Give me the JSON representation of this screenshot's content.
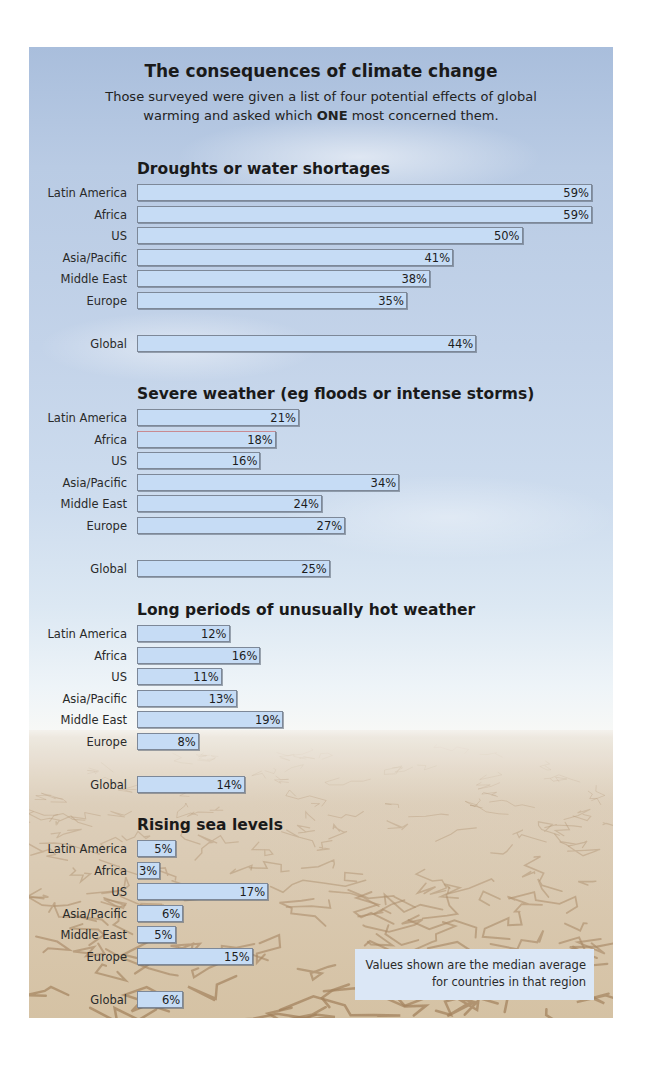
{
  "header": {
    "title": "The consequences of climate change",
    "subtitle_part1": "Those surveyed were given a list of four potential effects of global warming and asked which ",
    "subtitle_emphasis": "ONE",
    "subtitle_part2": " most concerned them."
  },
  "note": {
    "line1": "Values shown are the median average",
    "line2": "for countries in that region"
  },
  "colors": {
    "bar_fill": "#c6dcf5",
    "bar_border": "#7d8898",
    "note_fill": "#dbe7f6",
    "sky": "#b9cbe4",
    "ground": "#d5c2a4"
  },
  "chart_data": [
    {
      "type": "bar",
      "orientation": "horizontal",
      "title": "Droughts or water shortages",
      "categories": [
        "Latin America",
        "Africa",
        "US",
        "Asia/Pacific",
        "Middle East",
        "Europe",
        "Global"
      ],
      "values": [
        59,
        59,
        50,
        41,
        38,
        35,
        44
      ],
      "labels": [
        "59%",
        "59%",
        "50%",
        "41%",
        "38%",
        "35%",
        "44%"
      ],
      "unit": "%",
      "xlim": [
        0,
        60
      ]
    },
    {
      "type": "bar",
      "orientation": "horizontal",
      "title": "Severe weather (eg floods or intense storms)",
      "categories": [
        "Latin America",
        "Africa",
        "US",
        "Asia/Pacific",
        "Middle East",
        "Europe",
        "Global"
      ],
      "values": [
        21,
        18,
        16,
        34,
        24,
        27,
        25
      ],
      "labels": [
        "21%",
        "18%",
        "16%",
        "34%",
        "24%",
        "27%",
        "25%"
      ],
      "unit": "%",
      "xlim": [
        0,
        60
      ]
    },
    {
      "type": "bar",
      "orientation": "horizontal",
      "title": "Long periods of unusually hot weather",
      "categories": [
        "Latin America",
        "Africa",
        "US",
        "Asia/Pacific",
        "Middle East",
        "Europe",
        "Global"
      ],
      "values": [
        12,
        16,
        11,
        13,
        19,
        8,
        14
      ],
      "labels": [
        "12%",
        "16%",
        "11%",
        "13%",
        "19%",
        "8%",
        "14%"
      ],
      "unit": "%",
      "xlim": [
        0,
        60
      ]
    },
    {
      "type": "bar",
      "orientation": "horizontal",
      "title": "Rising sea levels",
      "categories": [
        "Latin America",
        "Africa",
        "US",
        "Asia/Pacific",
        "Middle East",
        "Europe",
        "Global"
      ],
      "values": [
        5,
        3,
        17,
        6,
        5,
        15,
        6
      ],
      "labels": [
        "5%",
        "3%",
        "17%",
        "6%",
        "5%",
        "15%",
        "6%"
      ],
      "unit": "%",
      "xlim": [
        0,
        60
      ]
    }
  ]
}
